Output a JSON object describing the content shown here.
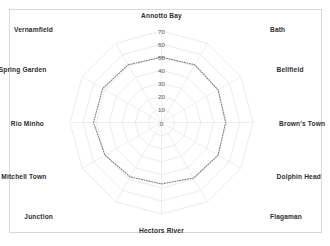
{
  "chart_data": {
    "type": "radar",
    "title": "",
    "subtitle": "",
    "xlabel": "",
    "ylabel": "",
    "grid": true,
    "legend": "none",
    "rlim": [
      0,
      70
    ],
    "r_tick_step": 10,
    "r_ticks": [
      "0",
      "10",
      "20",
      "30",
      "40",
      "50",
      "60",
      "70"
    ],
    "r_tick_values": [
      0,
      10,
      20,
      30,
      40,
      50,
      60,
      70
    ],
    "categories": [
      "Annotto Bay",
      "Bath",
      "Bellfield",
      "Brown's Town",
      "Dolphin Head",
      "Flagaman",
      "Hectors River",
      "Junction",
      "Mitchell Town",
      "Rio Minho",
      "Spring Garden",
      "Vernamfield"
    ],
    "series": [
      {
        "name": "",
        "style": "dotted",
        "color": "#7d7d7d",
        "values": [
          50,
          51,
          50,
          49,
          50,
          49,
          47,
          48,
          50,
          52,
          52,
          51
        ]
      }
    ],
    "grid_color": "#e3e3e3",
    "series_color": "#7d7d7d"
  },
  "frame": {
    "border_color": "#d9d9d9",
    "background": "#ffffff"
  }
}
